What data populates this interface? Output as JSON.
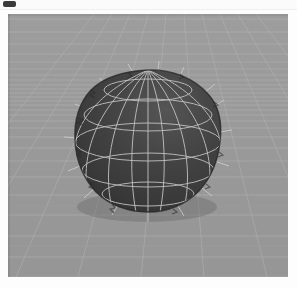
{
  "window": {
    "icon": "app-icon",
    "title": ""
  },
  "viewport": {
    "name": "3d-viewport",
    "background_color": "#9a9a9a",
    "grid_color": "#b4b4b4",
    "grid_minor_color": "#a6a6a6",
    "horizon_y": 96
  },
  "object": {
    "name": "sphere-mesh",
    "type": "uv-sphere",
    "surface_color": "#3d3d3d",
    "wireframe_color": "#c8c8c8",
    "center_x": 140,
    "center_y": 126,
    "radius_x": 72,
    "radius_y": 70,
    "latitude_rings": 5,
    "longitude_segments": 12,
    "shaded": true,
    "has_normals": true
  }
}
